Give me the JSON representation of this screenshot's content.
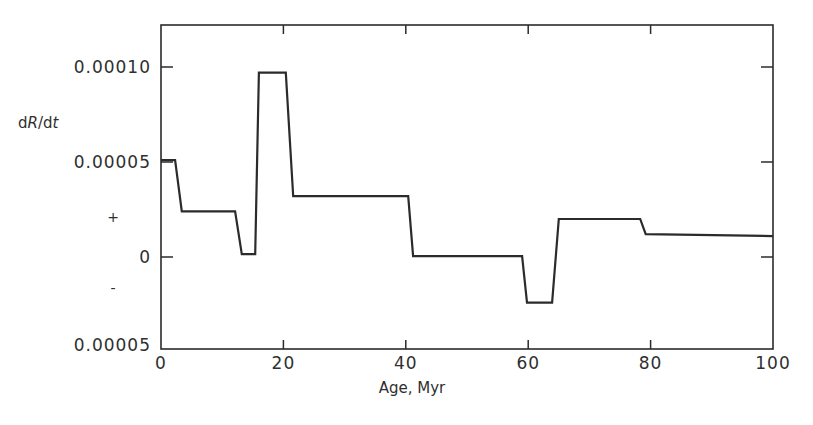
{
  "chart_data": {
    "type": "line",
    "title": "",
    "xlabel": "Age, Myr",
    "ylabel": "dR/dt",
    "xlim": [
      0,
      100
    ],
    "ylim": [
      -5e-05,
      0.000125
    ],
    "grid": false,
    "legend": null,
    "x_ticks": [
      0,
      20,
      40,
      60,
      80,
      100
    ],
    "x_tick_labels": [
      "0",
      "20",
      "40",
      "60",
      "80",
      "100"
    ],
    "y_ticks": [
      -5e-05,
      0,
      5e-05,
      0.0001
    ],
    "y_tick_labels": [
      "0.00005",
      "0",
      "0.00005",
      "0.00010"
    ],
    "y_sign_annotations": [
      {
        "text": "+",
        "y": 2.2e-05
      },
      {
        "text": "-",
        "y": -1.8e-05
      }
    ],
    "series": [
      {
        "name": "dR/dt",
        "x": [
          0,
          2.3,
          3.4,
          12.1,
          13.2,
          15.4,
          16.0,
          20.4,
          21.6,
          40.4,
          41.2,
          59.0,
          59.8,
          63.9,
          65.0,
          78.3,
          79.2,
          100
        ],
        "y": [
          5.1e-05,
          5.1e-05,
          2.4e-05,
          2.4e-05,
          1.5e-06,
          1.5e-06,
          9.7e-05,
          9.7e-05,
          3.2e-05,
          3.2e-05,
          5e-07,
          5e-07,
          -2.4e-05,
          -2.4e-05,
          2e-05,
          2e-05,
          1.2e-05,
          1.1e-05
        ]
      }
    ]
  },
  "labels": {
    "xlabel": "Age, Myr",
    "ylabel_d1": "d",
    "ylabel_R": "R",
    "ylabel_slash": "/d",
    "ylabel_t": "t",
    "plus": "+",
    "minus": "-"
  }
}
